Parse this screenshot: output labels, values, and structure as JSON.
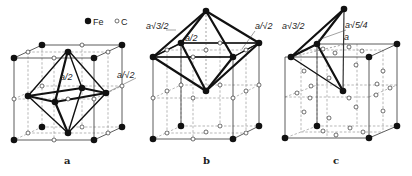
{
  "figure": {
    "legend": {
      "fe": {
        "symbol": "filled-circle",
        "label": "Fe"
      },
      "c": {
        "symbol": "open-circle",
        "label": "C"
      }
    },
    "panels": [
      {
        "id": "a",
        "label": "a",
        "caption": "Octahedral interstice (face-centre site)",
        "dimension_labels": [
          {
            "text": "a/2",
            "x": 60,
            "y": 80
          },
          {
            "text": "a/√2",
            "x": 117,
            "y": 78
          }
        ]
      },
      {
        "id": "b",
        "label": "b",
        "caption": "Octahedron spanning two cells",
        "dimension_labels": [
          {
            "text": "a√3/2",
            "x": 146,
            "y": 29
          },
          {
            "text": "a/2",
            "x": 185,
            "y": 41
          },
          {
            "text": "a/√2",
            "x": 255,
            "y": 29
          }
        ]
      },
      {
        "id": "c",
        "label": "c",
        "caption": "Tetrahedral interstice",
        "dimension_labels": [
          {
            "text": "a√3/2",
            "x": 282,
            "y": 29
          },
          {
            "text": "a√5/4",
            "x": 345,
            "y": 28
          },
          {
            "text": "a",
            "x": 344,
            "y": 40
          }
        ]
      }
    ]
  }
}
